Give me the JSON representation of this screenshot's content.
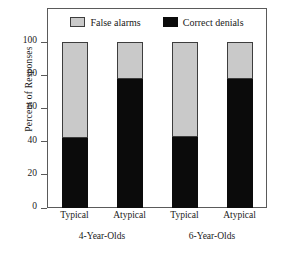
{
  "chart_data": {
    "type": "bar",
    "title": "",
    "subtitle": "",
    "stacked": true,
    "stack_total": 100,
    "xlabel": "",
    "ylabel": "Percent of Responses",
    "ylim": [
      0,
      100
    ],
    "yticks": [
      0,
      20,
      40,
      60,
      80,
      100
    ],
    "ytick_labels": [
      "0",
      "20",
      "40",
      "60",
      "80",
      "100"
    ],
    "grid": false,
    "legend_position": "top-inside",
    "categories": [
      "Typical",
      "Atypical",
      "Typical",
      "Atypical"
    ],
    "groups": [
      {
        "label": "4-Year-Olds",
        "categories": [
          "Typical",
          "Atypical"
        ]
      },
      {
        "label": "6-Year-Olds",
        "categories": [
          "Typical",
          "Atypical"
        ]
      }
    ],
    "series": [
      {
        "name": "Correct denials",
        "color": "#0b0b0b",
        "values": [
          42,
          78,
          43,
          78
        ]
      },
      {
        "name": "False alarms",
        "color": "#c9c9c9",
        "values": [
          58,
          22,
          57,
          22
        ]
      }
    ],
    "bars": [
      {
        "category": "Typical",
        "group": "4-Year-Olds",
        "correct_denials": 42,
        "false_alarms": 58
      },
      {
        "category": "Atypical",
        "group": "4-Year-Olds",
        "correct_denials": 78,
        "false_alarms": 22
      },
      {
        "category": "Typical",
        "group": "6-Year-Olds",
        "correct_denials": 43,
        "false_alarms": 57
      },
      {
        "category": "Atypical",
        "group": "6-Year-Olds",
        "correct_denials": 78,
        "false_alarms": 22
      }
    ]
  },
  "legend": {
    "entries": [
      {
        "label": "False alarms",
        "swatch": "gray"
      },
      {
        "label": "Correct denials",
        "swatch": "black"
      }
    ]
  },
  "colors": {
    "false_alarms": "#c9c9c9",
    "correct_denials": "#0b0b0b",
    "axis": "#5a5a5a",
    "text": "#1a1a1a"
  }
}
